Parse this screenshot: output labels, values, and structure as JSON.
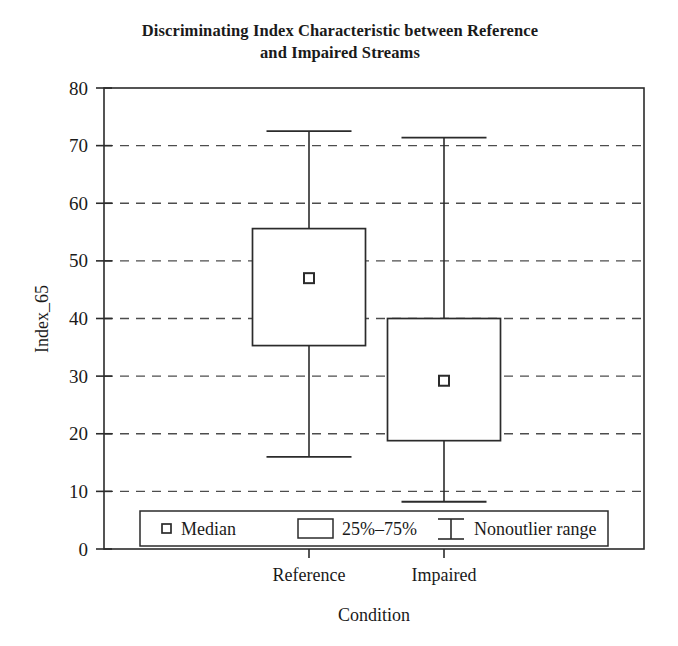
{
  "chart_data": {
    "type": "box",
    "title": "Discriminating Index Characteristic between Reference and Impaired Streams",
    "title_line1": "Discriminating Index Characteristic between Reference",
    "title_line2": "and Impaired Streams",
    "xlabel": "Condition",
    "ylabel": "Index_65",
    "categories": [
      "Reference",
      "Impaired"
    ],
    "ylim": [
      0,
      80
    ],
    "ytick_values": [
      0,
      10,
      20,
      30,
      40,
      50,
      60,
      70,
      80
    ],
    "ytick_labels": [
      "0",
      "10",
      "20",
      "30",
      "40",
      "50",
      "60",
      "70",
      "80"
    ],
    "grid": "horizontal-dashed",
    "series": [
      {
        "name": "Reference",
        "whisker_low": 16.0,
        "q1": 35.3,
        "median": 47.0,
        "q3": 55.6,
        "whisker_high": 72.5
      },
      {
        "name": "Impaired",
        "whisker_low": 8.2,
        "q1": 18.8,
        "median": 29.2,
        "q3": 40.0,
        "whisker_high": 71.4
      }
    ],
    "legend": {
      "position": "bottom-inside",
      "entries": [
        {
          "label": "Median",
          "marker": "small-square"
        },
        {
          "label": "25%–75%",
          "marker": "rectangle"
        },
        {
          "label": "Nonoutlier range",
          "marker": "i-beam"
        }
      ]
    },
    "colors": {
      "line": "#2b2b2b",
      "grid": "#4d4d4d",
      "background": "#ffffff"
    }
  }
}
